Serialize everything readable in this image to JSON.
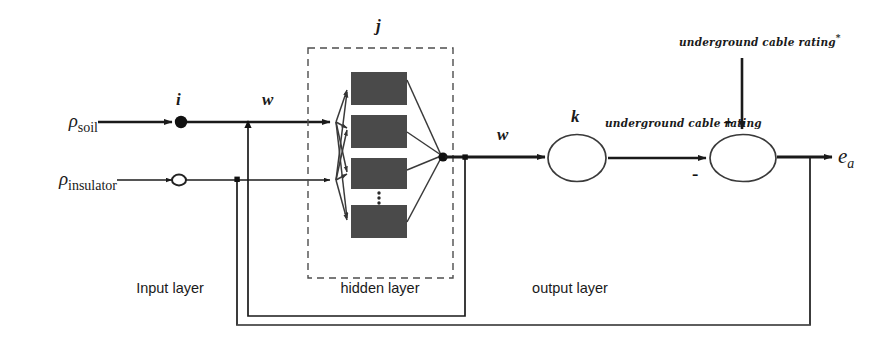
{
  "diagram": {
    "inputs": [
      {
        "id": "soil",
        "symbol": "ρ",
        "subscript": "soil",
        "node_style": "filled-dot"
      },
      {
        "id": "insulator",
        "symbol": "ρ",
        "subscript": "insulator",
        "node_style": "hollow-circle"
      }
    ],
    "indices": {
      "input_index": "i",
      "hidden_index": "j",
      "output_index": "k",
      "weight_in": "w",
      "weight_out": "w"
    },
    "layers": [
      {
        "id": "input",
        "label": "Input layer"
      },
      {
        "id": "hidden",
        "label": "hidden layer",
        "neuron_count": 4,
        "ellipsis": true
      },
      {
        "id": "output",
        "label": "output layer"
      }
    ],
    "signals": {
      "network_output": "underground cable rating",
      "target": "underground cable rating*",
      "target_base": "underground cable rating",
      "target_superscript": "*",
      "error": "e",
      "error_subscript": "a"
    },
    "summing_junction": {
      "plus_sign": "+",
      "minus_sign": "-"
    },
    "colors": {
      "neuron_fill": "#4a4a4a",
      "line": "#1a1a1a",
      "dashed_box": "#4d4d4d",
      "background": "#ffffff"
    }
  }
}
